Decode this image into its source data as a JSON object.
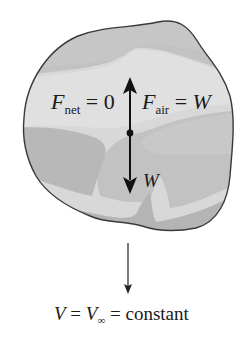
{
  "diagram": {
    "body": {
      "fill_light": "#dcdcdc",
      "fill_mid": "#c4c4c4",
      "fill_dark": "#b0b0b0",
      "outline": "#3a3a3a"
    },
    "labels": {
      "net_force": {
        "symbol": "F",
        "subscript": "net",
        "relation": " = 0"
      },
      "air_force": {
        "symbol": "F",
        "subscript": "air",
        "relation": " = ",
        "rhs": "W"
      },
      "weight": {
        "symbol": "W"
      },
      "velocity": {
        "lhs": "V",
        "eq1": " = ",
        "mid": "V",
        "mid_subscript": "∞",
        "eq2": " = constant"
      }
    },
    "arrows": [
      {
        "name": "air-resistance-force",
        "direction": "up"
      },
      {
        "name": "weight-force",
        "direction": "down"
      },
      {
        "name": "velocity-direction",
        "direction": "down"
      }
    ]
  }
}
